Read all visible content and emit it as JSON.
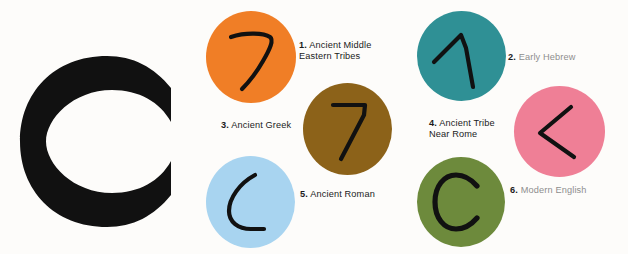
{
  "page": {
    "background_color": "#fdfcfa",
    "subject_letter": "C"
  },
  "display_letter": {
    "glyph": "C",
    "color": "#111111"
  },
  "colors": {
    "orange": "#f07e26",
    "teal": "#2f9095",
    "brown": "#8c6219",
    "pink": "#ef7f96",
    "light_blue": "#a8d4f0",
    "olive_green": "#6d8a3c",
    "ink": "#111111",
    "faded_text": "#8e8e8e"
  },
  "stages": [
    {
      "number": "1.",
      "label": "Ancient Middle\nEastern Tribes",
      "full_label": "1. Ancient Middle Eastern Tribes",
      "disc_color": "#f07e26",
      "glyph_name": "proto-sinaitic-gimel",
      "glyph_description": "curved seven-like hook stroke",
      "faded": false
    },
    {
      "number": "2.",
      "label": "Early Hebrew",
      "full_label": "2. Early Hebrew",
      "disc_color": "#2f9095",
      "glyph_name": "early-hebrew-gimel",
      "glyph_description": "inverted V with long right leg",
      "faded": true
    },
    {
      "number": "3.",
      "label": "Ancient Greek",
      "full_label": "3. Ancient Greek",
      "disc_color": "#8c6219",
      "glyph_name": "greek-gamma",
      "glyph_description": "angular seven shape",
      "faded": false
    },
    {
      "number": "4.",
      "label": "Ancient Tribe\nNear Rome",
      "full_label": "4. Ancient Tribe Near Rome",
      "disc_color": "#ef7f96",
      "glyph_name": "etruscan-gamma",
      "glyph_description": "less-than angle bracket",
      "faded": false
    },
    {
      "number": "5.",
      "label": "Ancient Roman",
      "full_label": "5. Ancient Roman",
      "disc_color": "#a8d4f0",
      "glyph_name": "roman-c-rounded",
      "glyph_description": "rounded open crescent",
      "faded": false
    },
    {
      "number": "6.",
      "label": "Modern English",
      "full_label": "6. Modern English",
      "disc_color": "#6d8a3c",
      "glyph_name": "modern-letter-c",
      "glyph_description": "modern capital C",
      "faded": false
    }
  ]
}
